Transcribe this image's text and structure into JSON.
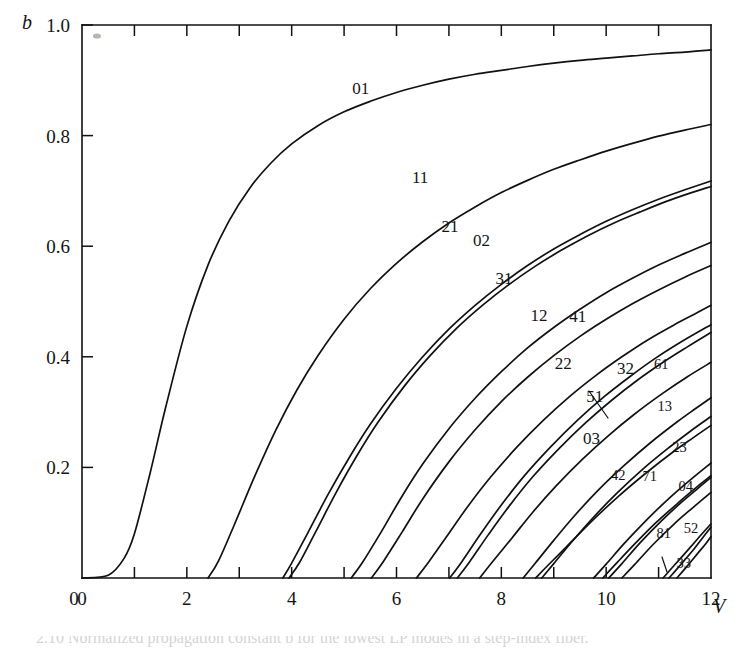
{
  "figure": {
    "y_axis_title": "b",
    "x_axis_title": "V"
  },
  "chart_data": {
    "type": "line",
    "title": "",
    "subtitle": "",
    "xlabel": "V",
    "ylabel": "b",
    "xlim": [
      0,
      12
    ],
    "ylim": [
      0,
      1.0
    ],
    "grid": false,
    "legend": "inline-curve-labels",
    "x_ticks_major": [
      0,
      2,
      4,
      6,
      8,
      10,
      12
    ],
    "x_ticks_minor": [
      1,
      3,
      5,
      7,
      9,
      11
    ],
    "x_tick_labels": [
      "0",
      "2",
      "4",
      "6",
      "8",
      "10",
      "12"
    ],
    "y_ticks_major": [
      0,
      0.2,
      0.4,
      0.6,
      0.8,
      1.0
    ],
    "y_tick_labels": [
      "0",
      "0.2",
      "0.4",
      "0.6",
      "0.8",
      "1.0"
    ],
    "series": [
      {
        "name": "01",
        "label": "01",
        "cutoff_V": 0.0,
        "b_at_Vmax": 0.955,
        "points": [
          [
            0.0,
            0.0
          ],
          [
            0.5,
            0.005
          ],
          [
            0.8,
            0.035
          ],
          [
            1.0,
            0.08
          ],
          [
            1.3,
            0.19
          ],
          [
            1.6,
            0.31
          ],
          [
            2.0,
            0.455
          ],
          [
            2.4,
            0.565
          ],
          [
            2.8,
            0.645
          ],
          [
            3.2,
            0.705
          ],
          [
            3.6,
            0.75
          ],
          [
            4.0,
            0.785
          ],
          [
            4.5,
            0.818
          ],
          [
            5.0,
            0.843
          ],
          [
            5.5,
            0.862
          ],
          [
            6.0,
            0.878
          ],
          [
            6.5,
            0.891
          ],
          [
            7.0,
            0.902
          ],
          [
            7.5,
            0.911
          ],
          [
            8.0,
            0.918
          ],
          [
            8.5,
            0.925
          ],
          [
            9.0,
            0.931
          ],
          [
            9.5,
            0.936
          ],
          [
            10.0,
            0.94
          ],
          [
            10.5,
            0.944
          ],
          [
            11.0,
            0.948
          ],
          [
            11.5,
            0.951
          ],
          [
            12.0,
            0.955
          ]
        ]
      },
      {
        "name": "11",
        "label": "11",
        "cutoff_V": 2.405,
        "b_at_Vmax": 0.89,
        "points": [
          [
            2.405,
            0.0
          ],
          [
            2.6,
            0.03
          ],
          [
            2.9,
            0.095
          ],
          [
            3.3,
            0.185
          ],
          [
            3.7,
            0.268
          ],
          [
            4.1,
            0.34
          ],
          [
            4.5,
            0.402
          ],
          [
            5.0,
            0.468
          ],
          [
            5.5,
            0.523
          ],
          [
            6.0,
            0.569
          ],
          [
            6.5,
            0.608
          ],
          [
            7.0,
            0.642
          ],
          [
            7.5,
            0.671
          ],
          [
            8.0,
            0.697
          ],
          [
            8.5,
            0.719
          ],
          [
            9.0,
            0.739
          ],
          [
            9.5,
            0.756
          ],
          [
            10.0,
            0.772
          ],
          [
            10.5,
            0.786
          ],
          [
            11.0,
            0.799
          ],
          [
            11.5,
            0.81
          ],
          [
            12.0,
            0.82
          ]
        ]
      },
      {
        "name": "21",
        "label": "21",
        "cutoff_V": 3.832,
        "b_at_Vmax": 0.82,
        "points": [
          [
            3.832,
            0.0
          ],
          [
            4.0,
            0.027
          ],
          [
            4.3,
            0.08
          ],
          [
            4.7,
            0.152
          ],
          [
            5.1,
            0.218
          ],
          [
            5.5,
            0.278
          ],
          [
            6.0,
            0.343
          ],
          [
            6.5,
            0.4
          ],
          [
            7.0,
            0.45
          ],
          [
            7.5,
            0.493
          ],
          [
            8.0,
            0.531
          ],
          [
            8.5,
            0.565
          ],
          [
            9.0,
            0.595
          ],
          [
            9.5,
            0.621
          ],
          [
            10.0,
            0.645
          ],
          [
            10.5,
            0.666
          ],
          [
            11.0,
            0.685
          ],
          [
            11.5,
            0.702
          ],
          [
            12.0,
            0.718
          ]
        ]
      },
      {
        "name": "02",
        "label": "02",
        "cutoff_V": 3.832,
        "b_at_Vmax": 0.805,
        "points": [
          [
            3.95,
            0.0
          ],
          [
            4.15,
            0.028
          ],
          [
            4.45,
            0.082
          ],
          [
            4.85,
            0.155
          ],
          [
            5.25,
            0.222
          ],
          [
            5.65,
            0.282
          ],
          [
            6.15,
            0.347
          ],
          [
            6.65,
            0.403
          ],
          [
            7.15,
            0.452
          ],
          [
            7.65,
            0.494
          ],
          [
            8.15,
            0.531
          ],
          [
            8.65,
            0.564
          ],
          [
            9.15,
            0.593
          ],
          [
            9.65,
            0.619
          ],
          [
            10.15,
            0.642
          ],
          [
            10.65,
            0.662
          ],
          [
            11.15,
            0.681
          ],
          [
            11.6,
            0.696
          ],
          [
            12.0,
            0.708
          ]
        ]
      },
      {
        "name": "31",
        "label": "31",
        "cutoff_V": 5.136,
        "b_at_Vmax": 0.72,
        "points": [
          [
            5.136,
            0.0
          ],
          [
            5.35,
            0.028
          ],
          [
            5.7,
            0.082
          ],
          [
            6.1,
            0.147
          ],
          [
            6.5,
            0.206
          ],
          [
            7.0,
            0.27
          ],
          [
            7.5,
            0.325
          ],
          [
            8.0,
            0.373
          ],
          [
            8.5,
            0.416
          ],
          [
            9.0,
            0.453
          ],
          [
            9.5,
            0.486
          ],
          [
            10.0,
            0.516
          ],
          [
            10.5,
            0.542
          ],
          [
            11.0,
            0.566
          ],
          [
            11.5,
            0.587
          ],
          [
            12.0,
            0.607
          ]
        ]
      },
      {
        "name": "12",
        "label": "12",
        "cutoff_V": 5.52,
        "b_at_Vmax": 0.655,
        "points": [
          [
            5.52,
            0.0
          ],
          [
            5.75,
            0.03
          ],
          [
            6.1,
            0.082
          ],
          [
            6.5,
            0.143
          ],
          [
            7.0,
            0.21
          ],
          [
            7.5,
            0.268
          ],
          [
            8.0,
            0.319
          ],
          [
            8.5,
            0.363
          ],
          [
            9.0,
            0.402
          ],
          [
            9.5,
            0.437
          ],
          [
            10.0,
            0.468
          ],
          [
            10.5,
            0.496
          ],
          [
            11.0,
            0.521
          ],
          [
            11.5,
            0.544
          ],
          [
            12.0,
            0.565
          ]
        ]
      },
      {
        "name": "41",
        "label": "41",
        "cutoff_V": 6.38,
        "b_at_Vmax": 0.57,
        "points": [
          [
            6.38,
            0.0
          ],
          [
            6.6,
            0.027
          ],
          [
            6.95,
            0.074
          ],
          [
            7.35,
            0.128
          ],
          [
            7.8,
            0.183
          ],
          [
            8.3,
            0.237
          ],
          [
            8.8,
            0.285
          ],
          [
            9.3,
            0.328
          ],
          [
            9.8,
            0.366
          ],
          [
            10.3,
            0.4
          ],
          [
            10.8,
            0.431
          ],
          [
            11.3,
            0.458
          ],
          [
            11.7,
            0.478
          ],
          [
            12.0,
            0.493
          ]
        ]
      },
      {
        "name": "22",
        "label": "22",
        "cutoff_V": 7.016,
        "b_at_Vmax": 0.555,
        "points": [
          [
            7.016,
            0.0
          ],
          [
            7.25,
            0.03
          ],
          [
            7.6,
            0.079
          ],
          [
            8.0,
            0.132
          ],
          [
            8.45,
            0.186
          ],
          [
            8.95,
            0.238
          ],
          [
            9.45,
            0.285
          ],
          [
            9.95,
            0.327
          ],
          [
            10.45,
            0.364
          ],
          [
            10.95,
            0.398
          ],
          [
            11.45,
            0.428
          ],
          [
            12.0,
            0.458
          ]
        ]
      },
      {
        "name": "03",
        "label": "03",
        "cutoff_V": 7.016,
        "b_at_Vmax": 0.52,
        "points": [
          [
            7.16,
            0.0
          ],
          [
            7.4,
            0.03
          ],
          [
            7.75,
            0.078
          ],
          [
            8.15,
            0.13
          ],
          [
            8.6,
            0.183
          ],
          [
            9.1,
            0.234
          ],
          [
            9.6,
            0.28
          ],
          [
            10.1,
            0.321
          ],
          [
            10.6,
            0.358
          ],
          [
            11.1,
            0.391
          ],
          [
            11.55,
            0.418
          ],
          [
            12.0,
            0.444
          ]
        ]
      },
      {
        "name": "51",
        "label": "51",
        "cutoff_V": 7.588,
        "b_at_Vmax": 0.4,
        "points": [
          [
            7.588,
            0.0
          ],
          [
            7.82,
            0.028
          ],
          [
            8.2,
            0.072
          ],
          [
            8.6,
            0.119
          ],
          [
            9.05,
            0.167
          ],
          [
            9.55,
            0.215
          ],
          [
            10.05,
            0.258
          ],
          [
            10.55,
            0.297
          ],
          [
            11.05,
            0.332
          ],
          [
            11.55,
            0.364
          ],
          [
            12.0,
            0.39
          ]
        ]
      },
      {
        "name": "32",
        "label": "32",
        "cutoff_V": 8.417,
        "b_at_Vmax": 0.355,
        "points": [
          [
            8.417,
            0.0
          ],
          [
            8.65,
            0.027
          ],
          [
            9.0,
            0.068
          ],
          [
            9.4,
            0.113
          ],
          [
            9.85,
            0.159
          ],
          [
            10.35,
            0.204
          ],
          [
            10.85,
            0.245
          ],
          [
            11.35,
            0.282
          ],
          [
            11.7,
            0.306
          ],
          [
            12.0,
            0.326
          ]
        ]
      },
      {
        "name": "61",
        "label": "61",
        "cutoff_V": 8.771,
        "b_at_Vmax": 0.32,
        "points": [
          [
            8.771,
            0.0
          ],
          [
            9.0,
            0.026
          ],
          [
            9.35,
            0.066
          ],
          [
            9.75,
            0.109
          ],
          [
            10.2,
            0.153
          ],
          [
            10.7,
            0.197
          ],
          [
            11.2,
            0.236
          ],
          [
            11.6,
            0.265
          ],
          [
            12.0,
            0.292
          ]
        ]
      },
      {
        "name": "13",
        "label": "13",
        "cutoff_V": 8.654,
        "b_at_Vmax": 0.245,
        "points": [
          [
            8.654,
            0.0
          ],
          [
            8.9,
            0.024
          ],
          [
            9.3,
            0.062
          ],
          [
            9.75,
            0.105
          ],
          [
            10.25,
            0.149
          ],
          [
            10.75,
            0.189
          ],
          [
            11.25,
            0.226
          ],
          [
            11.65,
            0.253
          ],
          [
            12.0,
            0.276
          ]
        ]
      },
      {
        "name": "42",
        "label": "42",
        "cutoff_V": 9.761,
        "b_at_Vmax": 0.215,
        "points": [
          [
            9.761,
            0.0
          ],
          [
            10.0,
            0.025
          ],
          [
            10.35,
            0.063
          ],
          [
            10.75,
            0.103
          ],
          [
            11.2,
            0.144
          ],
          [
            11.6,
            0.177
          ],
          [
            12.0,
            0.208
          ]
        ]
      },
      {
        "name": "71",
        "label": "71",
        "cutoff_V": 9.936,
        "b_at_Vmax": 0.19,
        "points": [
          [
            9.936,
            0.0
          ],
          [
            10.18,
            0.025
          ],
          [
            10.55,
            0.062
          ],
          [
            10.95,
            0.1
          ],
          [
            11.4,
            0.138
          ],
          [
            11.75,
            0.166
          ],
          [
            12.0,
            0.185
          ]
        ]
      },
      {
        "name": "23",
        "label": "23",
        "cutoff_V": 10.174,
        "b_at_Vmax": 0.175,
        "points": [
          [
            10.05,
            0.0
          ],
          [
            10.3,
            0.026
          ],
          [
            10.65,
            0.064
          ],
          [
            11.05,
            0.103
          ],
          [
            11.45,
            0.138
          ],
          [
            11.75,
            0.162
          ],
          [
            12.0,
            0.182
          ]
        ]
      },
      {
        "name": "04",
        "label": "04",
        "cutoff_V": 10.174,
        "b_at_Vmax": 0.155,
        "points": [
          [
            10.3,
            0.0
          ],
          [
            10.55,
            0.025
          ],
          [
            10.9,
            0.061
          ],
          [
            11.3,
            0.098
          ],
          [
            11.65,
            0.127
          ],
          [
            12.0,
            0.155
          ]
        ]
      },
      {
        "name": "81",
        "label": "81",
        "cutoff_V": 11.086,
        "b_at_Vmax": 0.105,
        "points": [
          [
            11.086,
            0.0
          ],
          [
            11.3,
            0.023
          ],
          [
            11.6,
            0.055
          ],
          [
            11.82,
            0.079
          ],
          [
            12.0,
            0.098
          ]
        ]
      },
      {
        "name": "52",
        "label": "52",
        "cutoff_V": 11.065,
        "b_at_Vmax": 0.105,
        "points": [
          [
            11.2,
            0.0
          ],
          [
            11.42,
            0.024
          ],
          [
            11.68,
            0.053
          ],
          [
            11.86,
            0.075
          ],
          [
            12.0,
            0.092
          ]
        ]
      },
      {
        "name": "33",
        "label": "33",
        "cutoff_V": 11.62,
        "b_at_Vmax": 0.045,
        "points": [
          [
            11.35,
            0.0
          ],
          [
            11.55,
            0.022
          ],
          [
            11.75,
            0.045
          ],
          [
            11.9,
            0.062
          ],
          [
            12.0,
            0.075
          ]
        ]
      }
    ],
    "curve_labels": [
      {
        "text": "01",
        "V": 5.32,
        "b": 0.875
      },
      {
        "text": "11",
        "V": 6.45,
        "b": 0.715
      },
      {
        "text": "21",
        "V": 7.02,
        "b": 0.625
      },
      {
        "text": "02",
        "V": 7.62,
        "b": 0.6
      },
      {
        "text": "31",
        "V": 8.05,
        "b": 0.532
      },
      {
        "text": "12",
        "V": 8.72,
        "b": 0.465
      },
      {
        "text": "41",
        "V": 9.46,
        "b": 0.463
      },
      {
        "text": "22",
        "V": 9.18,
        "b": 0.378
      },
      {
        "text": "32",
        "V": 10.37,
        "b": 0.368
      },
      {
        "text": "61",
        "V": 11.05,
        "b": 0.378
      },
      {
        "text": "51",
        "V": 9.78,
        "b": 0.318
      },
      {
        "text": "03",
        "V": 9.72,
        "b": 0.243
      },
      {
        "text": "13",
        "V": 11.12,
        "b": 0.302
      },
      {
        "text": "23",
        "V": 11.4,
        "b": 0.228
      },
      {
        "text": "42",
        "V": 10.23,
        "b": 0.178
      },
      {
        "text": "71",
        "V": 10.83,
        "b": 0.175
      },
      {
        "text": "04",
        "V": 11.52,
        "b": 0.158
      },
      {
        "text": "81",
        "V": 11.1,
        "b": 0.072
      },
      {
        "text": "52",
        "V": 11.62,
        "b": 0.082
      },
      {
        "text": "33",
        "V": 11.48,
        "b": 0.018
      }
    ]
  },
  "caption": {
    "text": "2.10   Normalized propagation constant b for the lowest LP modes in a step-index fiber."
  }
}
